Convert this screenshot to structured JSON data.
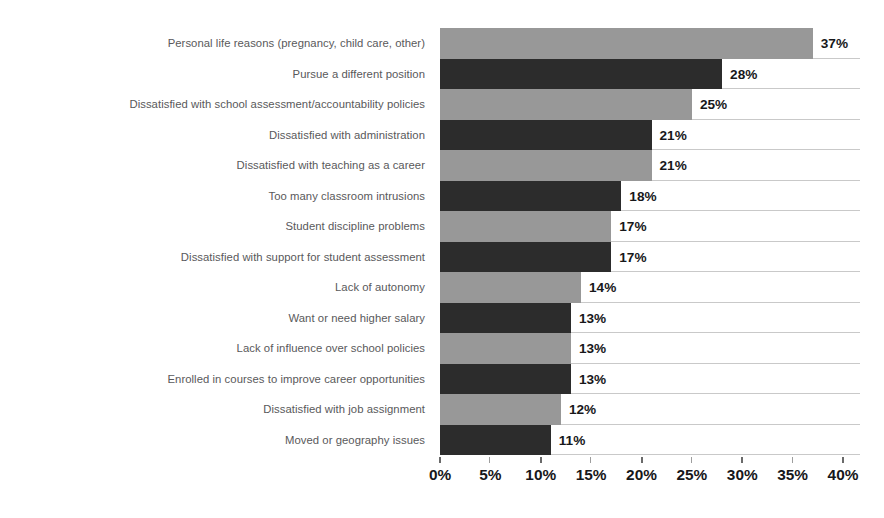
{
  "chart_data": {
    "type": "bar",
    "orientation": "horizontal",
    "title": "",
    "subtitle": "",
    "xlabel": "",
    "ylabel": "",
    "xlim": [
      0,
      40
    ],
    "xtick_step": 5,
    "grid": true,
    "legend": "none",
    "value_suffix": "%",
    "categories": [
      "Personal life reasons (pregnancy, child care, other)",
      "Pursue a different position",
      "Dissatisfied with school assessment/accountability policies",
      "Dissatisfied with administration",
      "Dissatisfied with teaching as a career",
      "Too many classroom intrusions",
      "Student discipline problems",
      "Dissatisfied with support for student assessment",
      "Lack of autonomy",
      "Want or need higher salary",
      "Lack of influence over school policies",
      "Enrolled in courses to improve career opportunities",
      "Dissatisfied with job assignment",
      "Moved or geography issues"
    ],
    "values": [
      37,
      28,
      25,
      21,
      21,
      18,
      17,
      17,
      14,
      13,
      13,
      13,
      12,
      11
    ],
    "value_labels": [
      "37%",
      "28%",
      "25%",
      "21%",
      "21%",
      "18%",
      "17%",
      "17%",
      "14%",
      "13%",
      "13%",
      "13%",
      "12%",
      "11%"
    ],
    "xticks": [
      0,
      5,
      10,
      15,
      20,
      25,
      30,
      35,
      40
    ],
    "xtick_labels": [
      "0%",
      "5%",
      "10%",
      "15%",
      "20%",
      "25%",
      "30%",
      "35%",
      "40%"
    ],
    "bar_colors": [
      "#989898",
      "#2c2c2c"
    ],
    "colors": {
      "light_bar": "#989898",
      "dark_bar": "#2c2c2c",
      "gridline": "#c9c9c9",
      "category_label": "#59595b",
      "value_label": "#17171a",
      "background": "#ffffff"
    }
  }
}
